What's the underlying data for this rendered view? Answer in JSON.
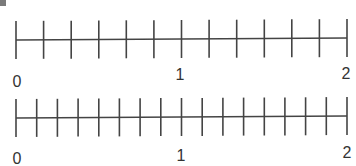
{
  "figure": {
    "line_color": "#444444",
    "label_color": "#333333"
  },
  "number_lines": [
    {
      "id": "sixths",
      "start": 0,
      "end": 2,
      "divisions_per_unit": 6,
      "tick_count": 13,
      "x_start": 16,
      "x_end": 347,
      "y_left": 40,
      "y_right": 38,
      "tick_half_height": 19,
      "labels": [
        {
          "text": "0",
          "value": 0,
          "x": 17,
          "y": 87
        },
        {
          "text": "1",
          "value": 1,
          "x": 180,
          "y": 80
        },
        {
          "text": "2",
          "value": 2,
          "x": 346,
          "y": 79
        }
      ]
    },
    {
      "id": "eighths",
      "start": 0,
      "end": 2,
      "divisions_per_unit": 8,
      "tick_count": 17,
      "x_start": 16,
      "x_end": 347,
      "y_left": 118,
      "y_right": 116,
      "tick_half_height": 19,
      "labels": [
        {
          "text": "0",
          "value": 0,
          "x": 17,
          "y": 164
        },
        {
          "text": "1",
          "value": 1,
          "x": 181,
          "y": 161
        },
        {
          "text": "2",
          "value": 2,
          "x": 347,
          "y": 158
        }
      ]
    }
  ]
}
